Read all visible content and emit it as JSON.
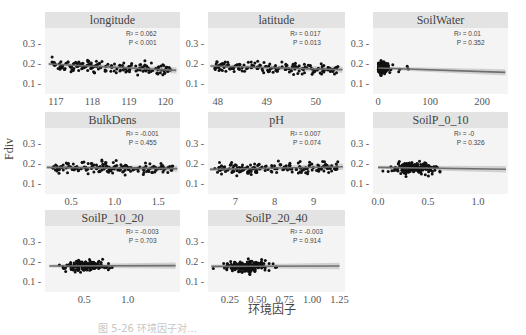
{
  "figure": {
    "y_axis_label": "Fdiv",
    "x_axis_label": "环境因子",
    "caption_partial": "图 5-26  环境因子对…"
  },
  "chart_data": {
    "type": "scatter",
    "layout": "facet grid 3x3 (8 panels), shared y-axis",
    "ylabel": "Fdiv",
    "xlabel": "环境因子",
    "ylim": [
      0.05,
      0.38
    ],
    "yticks": [
      "0.1",
      "0.2",
      "0.3"
    ],
    "grid": false,
    "panels": [
      {
        "title": "longitude",
        "xticks": [
          "117",
          "118",
          "119",
          "120"
        ],
        "xlim": [
          116.7,
          120.4
        ],
        "r2": "R² = 0.062",
        "p": "P < 0.001",
        "fit": {
          "x0": 116.8,
          "y0": 0.2,
          "x1": 120.3,
          "y1": 0.168
        }
      },
      {
        "title": "latitude",
        "xticks": [
          "48",
          "49",
          "50"
        ],
        "xlim": [
          47.8,
          50.6
        ],
        "r2": "R² = 0.017",
        "p": "P = 0.013",
        "fit": {
          "x0": 47.85,
          "y0": 0.19,
          "x1": 50.55,
          "y1": 0.172
        }
      },
      {
        "title": "SoilWater",
        "xticks": [
          "0",
          "100",
          "200"
        ],
        "xlim": [
          -10,
          250
        ],
        "r2": "R² = 0.01",
        "p": "P = 0.352",
        "fit": {
          "x0": 0,
          "y0": 0.18,
          "x1": 245,
          "y1": 0.158
        }
      },
      {
        "title": "BulkDens",
        "xticks": [
          "0.5",
          "1.0",
          "1.5"
        ],
        "xlim": [
          0.2,
          1.75
        ],
        "r2": "R² = -0.001",
        "p": "P = 0.455",
        "fit": {
          "x0": 0.22,
          "y0": 0.183,
          "x1": 1.72,
          "y1": 0.177
        }
      },
      {
        "title": "pH",
        "xticks": [
          "7",
          "8",
          "9"
        ],
        "xlim": [
          6.3,
          9.8
        ],
        "r2": "R² = 0.007",
        "p": "P = 0.074",
        "fit": {
          "x0": 6.35,
          "y0": 0.173,
          "x1": 9.75,
          "y1": 0.186
        }
      },
      {
        "title": "SoilP_0_10",
        "xticks": [
          "0.0",
          "0.5",
          "1.0"
        ],
        "xlim": [
          -0.05,
          1.3
        ],
        "r2": "R² = -0",
        "p": "P = 0.326",
        "fit": {
          "x0": 0,
          "y0": 0.183,
          "x1": 1.28,
          "y1": 0.174
        }
      },
      {
        "title": "SoilP_10_20",
        "xticks": [
          "0.5",
          "1.0"
        ],
        "xlim": [
          0.05,
          1.6
        ],
        "r2": "R² = -0.003",
        "p": "P = 0.703",
        "fit": {
          "x0": 0.1,
          "y0": 0.18,
          "x1": 1.55,
          "y1": 0.182
        }
      },
      {
        "title": "SoilP_20_40",
        "xticks": [
          "0.25",
          "0.50",
          "0.75",
          "1.00",
          "1.25"
        ],
        "xlim": [
          0.05,
          1.3
        ],
        "r2": "R² = -0.003",
        "p": "P = 0.914",
        "fit": {
          "x0": 0.08,
          "y0": 0.178,
          "x1": 1.25,
          "y1": 0.18
        }
      }
    ]
  },
  "colors": {
    "points": "#111111",
    "fit_line": "#6e6e6e",
    "ci_band": "#c8c8c8",
    "panel_bg": "#f4f4f4",
    "strip_bg": "#e3e3e3"
  }
}
